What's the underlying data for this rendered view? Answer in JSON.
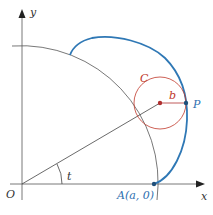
{
  "diagram": {
    "labels": {
      "y_axis": "y",
      "x_axis": "x",
      "origin": "O",
      "angle": "t",
      "point_a": "A(a, 0)",
      "point_p": "P",
      "circle_c": "C",
      "radius_b": "b"
    },
    "colors": {
      "axis": "#555555",
      "big_circle": "#555555",
      "curve": "#2f78b5",
      "small_circle": "#c0392b",
      "center_dot": "#b03030",
      "point_dot": "#1f4f7a",
      "radius_line": "#b03030"
    }
  }
}
